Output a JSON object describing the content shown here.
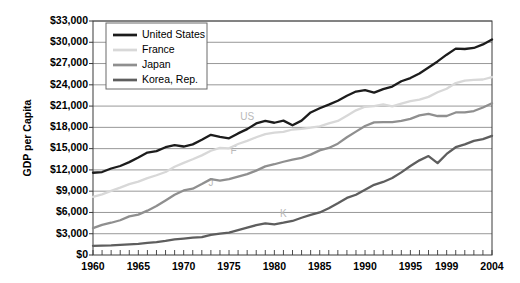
{
  "chart_data": {
    "type": "line",
    "title": "",
    "xlabel": "",
    "ylabel": "GDP per Capita",
    "xlim": [
      1960,
      2004
    ],
    "ylim": [
      0,
      33000
    ],
    "grid": true,
    "legend_position": "top-left",
    "y_ticks": [
      "$0",
      "$3,000",
      "$6,000",
      "$9,000",
      "$12,000",
      "$15,000",
      "$18,000",
      "$21,000",
      "$24,000",
      "$27,000",
      "$30,000",
      "$33,000"
    ],
    "y_tick_values": [
      0,
      3000,
      6000,
      9000,
      12000,
      15000,
      18000,
      21000,
      24000,
      27000,
      30000,
      33000
    ],
    "x_ticks": [
      "1960",
      "1965",
      "1970",
      "1975",
      "1980",
      "1985",
      "1990",
      "1995",
      "1999",
      "2004"
    ],
    "x_tick_values": [
      1960,
      1965,
      1970,
      1975,
      1980,
      1985,
      1990,
      1995,
      1999,
      2004
    ],
    "x": [
      1960,
      1961,
      1962,
      1963,
      1964,
      1965,
      1966,
      1967,
      1968,
      1969,
      1970,
      1971,
      1972,
      1973,
      1974,
      1975,
      1976,
      1977,
      1978,
      1979,
      1980,
      1981,
      1982,
      1983,
      1984,
      1985,
      1986,
      1987,
      1988,
      1989,
      1990,
      1991,
      1992,
      1993,
      1994,
      1995,
      1996,
      1997,
      1998,
      1999,
      2000,
      2001,
      2002,
      2003,
      2004
    ],
    "series": [
      {
        "name": "United States",
        "color": "#1c1c1c",
        "width": 2.3,
        "values": [
          11600,
          11700,
          12200,
          12550,
          13100,
          13750,
          14450,
          14650,
          15200,
          15500,
          15300,
          15600,
          16250,
          16950,
          16650,
          16450,
          17150,
          17750,
          18550,
          18900,
          18650,
          18950,
          18300,
          18950,
          20100,
          20700,
          21200,
          21750,
          22450,
          23050,
          23250,
          22900,
          23400,
          23750,
          24500,
          24950,
          25600,
          26450,
          27300,
          28250,
          29100,
          29050,
          29200,
          29700,
          30400
        ]
      },
      {
        "name": "France",
        "color": "#d8d8d8",
        "width": 2.3,
        "values": [
          8200,
          8550,
          9050,
          9500,
          10000,
          10350,
          10850,
          11250,
          11700,
          12450,
          13000,
          13500,
          14050,
          14700,
          15100,
          15050,
          15650,
          16100,
          16600,
          17050,
          17250,
          17350,
          17700,
          17800,
          17950,
          18150,
          18550,
          18900,
          19650,
          20400,
          20900,
          21000,
          21250,
          20950,
          21350,
          21700,
          21900,
          22300,
          22950,
          23450,
          24250,
          24600,
          24700,
          24750,
          25100
        ]
      },
      {
        "name": "Japan",
        "color": "#8f8f8f",
        "width": 2.3,
        "values": [
          3800,
          4250,
          4550,
          4900,
          5450,
          5700,
          6250,
          6900,
          7700,
          8500,
          9100,
          9350,
          10000,
          10700,
          10500,
          10700,
          11050,
          11400,
          11900,
          12500,
          12800,
          13150,
          13450,
          13700,
          14150,
          14750,
          15100,
          15700,
          16600,
          17400,
          18200,
          18700,
          18750,
          18750,
          18900,
          19200,
          19700,
          19900,
          19600,
          19600,
          20100,
          20100,
          20300,
          20800,
          21400
        ]
      },
      {
        "name": "Korea, Rep.",
        "color": "#5e5e5e",
        "width": 2.3,
        "values": [
          1300,
          1320,
          1360,
          1430,
          1500,
          1570,
          1710,
          1820,
          1980,
          2190,
          2310,
          2440,
          2520,
          2830,
          3020,
          3170,
          3520,
          3870,
          4200,
          4450,
          4330,
          4550,
          4800,
          5250,
          5650,
          6000,
          6600,
          7300,
          8050,
          8500,
          9200,
          9900,
          10300,
          10850,
          11650,
          12550,
          13350,
          13950,
          12950,
          14250,
          15200,
          15600,
          16100,
          16350,
          16800
        ]
      }
    ],
    "annotations": [
      {
        "text": "US",
        "x": 1977.0,
        "y": 19000
      },
      {
        "text": "F",
        "x": 1975.5,
        "y": 14200
      },
      {
        "text": "J",
        "x": 1973.0,
        "y": 9800
      },
      {
        "text": "K",
        "x": 1981.0,
        "y": 5400
      }
    ]
  },
  "legend": {
    "entries": [
      {
        "label": "United States"
      },
      {
        "label": "France"
      },
      {
        "label": "Japan"
      },
      {
        "label": "Korea, Rep."
      }
    ]
  },
  "axes": {
    "y_title": "GDP per Capita"
  },
  "colors": {
    "gridline": "#8c8c8c",
    "axis": "#3a3a3a",
    "plot_background": "#ffffff",
    "legend_border": "#6b6b6b"
  }
}
